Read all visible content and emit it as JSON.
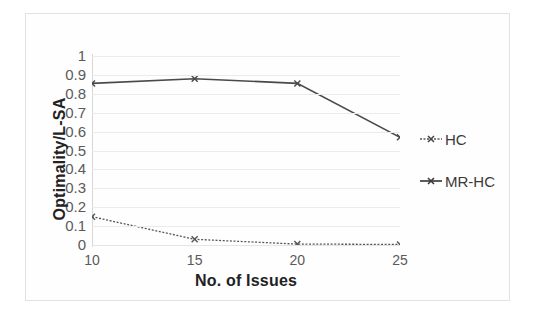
{
  "chart_data": {
    "type": "line",
    "title": "",
    "xlabel": "No. of Issues",
    "ylabel": "Optimality/L-SA",
    "categories": [
      10,
      15,
      20,
      25
    ],
    "x_tick_labels": [
      "10",
      "15",
      "20",
      "25"
    ],
    "y_tick_labels": [
      "1",
      "0.9",
      "0.8",
      "0.7",
      "0.6",
      "0.5",
      "0.4",
      "0.3",
      "0.2",
      "0.1",
      "0"
    ],
    "y_tick_values": [
      1,
      0.9,
      0.8,
      0.7,
      0.6,
      0.5,
      0.4,
      0.3,
      0.2,
      0.1,
      0
    ],
    "ylim": [
      0,
      1
    ],
    "grid": true,
    "grid_axis": "y",
    "legend_position": "right",
    "series": [
      {
        "name": "HC",
        "values": [
          0.15,
          0.03,
          0.005,
          0.003
        ],
        "color": "#555555",
        "marker": "x",
        "line_style": "dotted"
      },
      {
        "name": "MR-HC",
        "values": [
          0.855,
          0.88,
          0.855,
          0.57
        ],
        "color": "#4a4a4a",
        "marker": "x",
        "line_style": "solid"
      }
    ]
  },
  "legend": {
    "items": [
      {
        "label": "HC",
        "color": "#555555"
      },
      {
        "label": "MR-HC",
        "color": "#4a4a4a"
      }
    ]
  },
  "colors": {
    "series_hc": "#555555",
    "series_mrhc": "#4a4a4a",
    "grid": "#eceaea",
    "frame": "#e2e2e2",
    "tick_text": "#5a5a5a",
    "title_text": "#222222"
  }
}
